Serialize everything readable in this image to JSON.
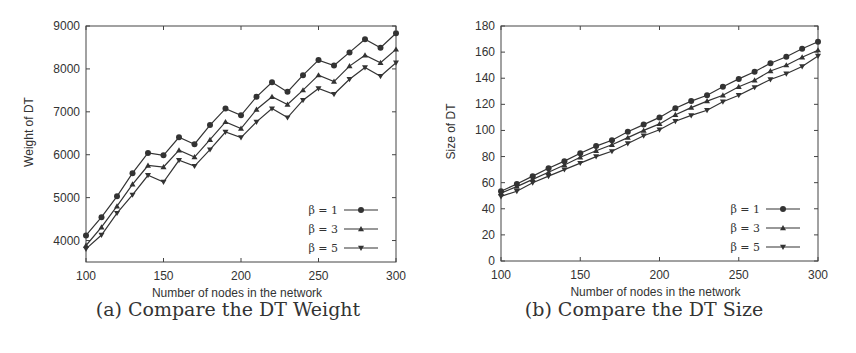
{
  "figure": {
    "captions": [
      "(a) Compare the DT Weight",
      "(b) Compare the DT Size"
    ]
  },
  "chart_data": [
    {
      "type": "line",
      "title": "(a) Compare the DT Weight",
      "xlabel": "Number of nodes in the network",
      "ylabel": "Weight of DT",
      "xlim": [
        100,
        300
      ],
      "ylim": [
        3500,
        9000
      ],
      "xticks": [
        100,
        150,
        200,
        250,
        300
      ],
      "yticks": [
        4000,
        5000,
        6000,
        7000,
        8000,
        9000
      ],
      "grid": false,
      "legend_position": "lower right",
      "x": [
        100,
        110,
        120,
        130,
        140,
        150,
        160,
        170,
        180,
        190,
        200,
        210,
        220,
        230,
        240,
        250,
        260,
        270,
        280,
        290,
        300
      ],
      "series": [
        {
          "name": "β = 1",
          "marker": "circle",
          "values": [
            4120,
            4545,
            5030,
            5570,
            6040,
            5985,
            6405,
            6245,
            6690,
            7075,
            6920,
            7350,
            7690,
            7465,
            7855,
            8205,
            8080,
            8385,
            8690,
            8495,
            8830
          ]
        },
        {
          "name": "β = 3",
          "marker": "triangle-up",
          "values": [
            3885,
            4310,
            4800,
            5310,
            5750,
            5715,
            6105,
            5945,
            6350,
            6765,
            6610,
            7055,
            7350,
            7170,
            7505,
            7855,
            7705,
            8065,
            8320,
            8145,
            8455
          ]
        },
        {
          "name": "β = 5",
          "marker": "triangle-down",
          "values": [
            3805,
            4130,
            4640,
            5065,
            5520,
            5365,
            5870,
            5735,
            6120,
            6530,
            6400,
            6765,
            7075,
            6865,
            7270,
            7545,
            7410,
            7760,
            8035,
            7830,
            8145
          ]
        }
      ]
    },
    {
      "type": "line",
      "title": "(b) Compare the DT Size",
      "xlabel": "Number of nodes in the network",
      "ylabel": "Size of DT",
      "xlim": [
        100,
        300
      ],
      "ylim": [
        0,
        180
      ],
      "xticks": [
        100,
        150,
        200,
        250,
        300
      ],
      "yticks": [
        0,
        20,
        40,
        60,
        80,
        100,
        120,
        140,
        160,
        180
      ],
      "grid": false,
      "legend_position": "lower right",
      "x": [
        100,
        110,
        120,
        130,
        140,
        150,
        160,
        170,
        180,
        190,
        200,
        210,
        220,
        230,
        240,
        250,
        260,
        270,
        280,
        290,
        300
      ],
      "series": [
        {
          "name": "β = 1",
          "marker": "circle",
          "values": [
            53.5,
            59,
            65,
            71,
            76.5,
            82.5,
            88,
            92.5,
            99,
            104.5,
            110,
            117,
            122.5,
            127,
            133.5,
            139.5,
            145,
            151.5,
            156.5,
            162.5,
            168
          ]
        },
        {
          "name": "β = 3",
          "marker": "triangle-up",
          "values": [
            52,
            57,
            62.5,
            68,
            73.5,
            79.5,
            84.5,
            89,
            94.5,
            100,
            105,
            112,
            117.5,
            122.5,
            127,
            133.5,
            138.5,
            145.5,
            150,
            156,
            161.5
          ]
        },
        {
          "name": "β = 5",
          "marker": "triangle-down",
          "values": [
            49.5,
            53.5,
            60,
            65,
            70,
            75,
            80,
            84,
            90,
            96,
            100.5,
            107,
            111.5,
            115.5,
            122,
            127,
            133,
            139,
            143.5,
            149,
            157
          ]
        }
      ]
    }
  ],
  "colors": {
    "line": "#333333",
    "axis": "#444444",
    "text": "#333333"
  }
}
